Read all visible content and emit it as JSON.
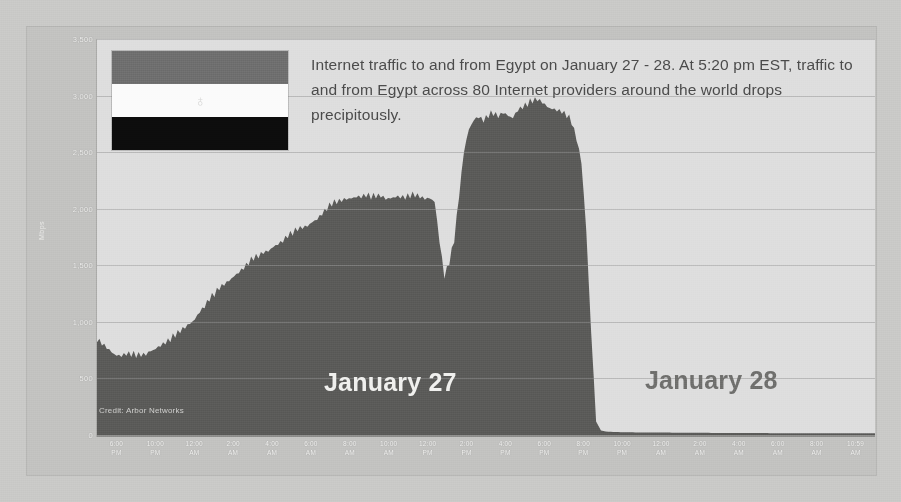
{
  "annotation": {
    "text": "Internet traffic to and from Egypt on January 27 - 28. At 5:20 pm EST, traffic to and from Egypt across 80 Internet providers around the world  drops precipitously."
  },
  "credit": "Credit: Arbor Networks",
  "day_labels": {
    "day1": "January 27",
    "day2": "January 28"
  },
  "flag": {
    "name": "egypt-flag",
    "stripes": [
      "#6e6e6e",
      "#fbfbfb",
      "#0d0d0d"
    ],
    "emblem": "♁"
  },
  "colors": {
    "background": "#c9c9c7",
    "frame": "#c2c2c0",
    "plot_background": "#dedede",
    "traffic_fill": "#5a5a58",
    "gridline": "#969696",
    "axis_text": "#f2f2f0",
    "annotation_text": "#4b4b4b",
    "day1_text": "#f0f0ee",
    "day2_text": "#6f6f6d"
  },
  "chart_data": {
    "type": "area",
    "title": "Internet traffic to and from Egypt on January 27 - 28",
    "xlabel": "",
    "ylabel": "Mbps",
    "ylim": [
      0,
      3500
    ],
    "yticks": [
      "0",
      "500",
      "1,000",
      "1,500",
      "2,000",
      "2,500",
      "3,000",
      "3,500"
    ],
    "ytick_values": [
      0,
      500,
      1000,
      1500,
      2000,
      2500,
      3000,
      3500
    ],
    "grid": true,
    "legend": "none",
    "xticks": [
      {
        "time": "6:00",
        "period": "PM"
      },
      {
        "time": "10:00",
        "period": "PM"
      },
      {
        "time": "12:00",
        "period": "AM"
      },
      {
        "time": "2:00",
        "period": "AM"
      },
      {
        "time": "4:00",
        "period": "AM"
      },
      {
        "time": "6:00",
        "period": "AM"
      },
      {
        "time": "8:00",
        "period": "AM"
      },
      {
        "time": "10:00",
        "period": "AM"
      },
      {
        "time": "12:00",
        "period": "PM"
      },
      {
        "time": "2:00",
        "period": "PM"
      },
      {
        "time": "4:00",
        "period": "PM"
      },
      {
        "time": "6:00",
        "period": "PM"
      },
      {
        "time": "8:00",
        "period": "PM"
      },
      {
        "time": "10:00",
        "period": "PM"
      },
      {
        "time": "12:00",
        "period": "AM"
      },
      {
        "time": "2:00",
        "period": "AM"
      },
      {
        "time": "4:00",
        "period": "AM"
      },
      {
        "time": "6:00",
        "period": "AM"
      },
      {
        "time": "8:00",
        "period": "AM"
      },
      {
        "time": "10:59",
        "period": "AM"
      }
    ],
    "series": [
      {
        "name": "Egypt Internet traffic (Mbps)",
        "values": [
          820,
          790,
          760,
          730,
          700,
          690,
          700,
          690,
          680,
          690,
          700,
          740,
          760,
          780,
          800,
          820,
          860,
          900,
          940,
          980,
          1020,
          1080,
          1120,
          1180,
          1220,
          1280,
          1320,
          1360,
          1400,
          1430,
          1460,
          1500,
          1540,
          1560,
          1600,
          1620,
          1660,
          1680,
          1700,
          1740,
          1760,
          1800,
          1820,
          1840,
          1880,
          1900,
          1940,
          1980,
          2020,
          2040,
          2060,
          2080,
          2090,
          2100,
          2090,
          2100,
          2080,
          2090,
          2100,
          2080,
          2090,
          2100,
          2090,
          2080,
          2090,
          2100,
          2090,
          2080,
          2090,
          2060,
          1700,
          1380,
          1500,
          1700,
          2100,
          2500,
          2700,
          2780,
          2800,
          2760,
          2800,
          2820,
          2800,
          2840,
          2820,
          2800,
          2860,
          2880,
          2900,
          2930,
          2950,
          2930,
          2900,
          2880,
          2860,
          2840,
          2800,
          2740,
          2600,
          2400,
          1800,
          900,
          120,
          40,
          30,
          28,
          26,
          25,
          24,
          24,
          23,
          23,
          22,
          22,
          22,
          21,
          21,
          21,
          20,
          20,
          20,
          20,
          19,
          19,
          19,
          19,
          18,
          18,
          18,
          18,
          18,
          18,
          17,
          17,
          17,
          17,
          17,
          17,
          16,
          16,
          16,
          16,
          16,
          16,
          16,
          16,
          16,
          16,
          16,
          16,
          16,
          16,
          16,
          16,
          16,
          16,
          16,
          16,
          16,
          16
        ]
      }
    ],
    "annotation": "At 5:20 pm EST, traffic to and from Egypt across 80 Internet providers around the world drops precipitously.",
    "drop_time": "5:20 pm EST",
    "peak_value": 2950,
    "post_drop_value": 16
  }
}
